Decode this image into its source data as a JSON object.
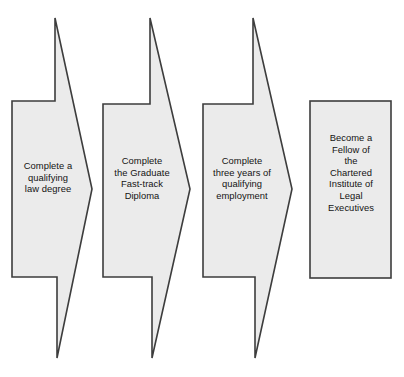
{
  "diagram": {
    "type": "process-flow",
    "background_color": "#ffffff",
    "shape_fill_color": "#ebebeb",
    "shape_border_color": "#3d3d3d",
    "text_color": "#131313",
    "steps": [
      {
        "id": "step-1",
        "shape": "chevron-arrow",
        "order": "1",
        "label": "Complete a\nqualifying\nlaw degree",
        "lines": [
          "Complete a",
          "qualifying",
          "law degree"
        ]
      },
      {
        "id": "step-2",
        "shape": "chevron-arrow",
        "order": "2",
        "label": "Complete\nthe Graduate\nFast-track\nDiploma",
        "lines": [
          "Complete",
          "the Graduate",
          "Fast-track",
          "Diploma"
        ]
      },
      {
        "id": "step-3",
        "shape": "chevron-arrow",
        "order": "3",
        "label": "Complete\nthree years of\nqualifying\nemployment",
        "lines": [
          "Complete",
          "three years of",
          "qualifying",
          "employment"
        ]
      },
      {
        "id": "step-4",
        "shape": "rectangle",
        "order": "4",
        "label": "Become a\nFellow of\nthe\nChartered\nInstitute of\nLegal\nExecutives",
        "lines": [
          "Become a",
          "Fellow of",
          "the",
          "Chartered",
          "Institute of",
          "Legal",
          "Executives"
        ]
      }
    ],
    "geometry": {
      "chevron_points_1": "55,18 92,189 57,358 57,277 12,277 12,101 55,101",
      "chevron_points_2": "150,18 190,189 152,358 152,277 103,277 103,104 150,104",
      "chevron_points_3": "253,18 292,189 255,358 255,277 203,277 203,104 253,104",
      "rect_1": {
        "x": "310",
        "y": "101",
        "width": "81",
        "height": "177"
      }
    }
  }
}
